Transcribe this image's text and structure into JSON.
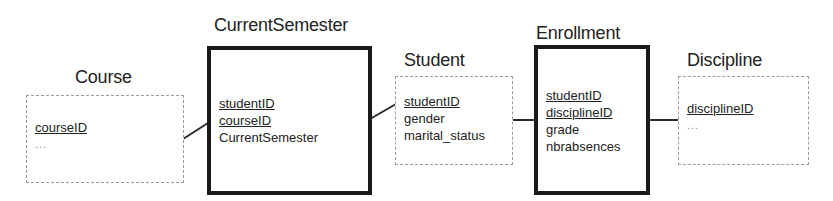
{
  "diagram": {
    "type": "entity-relationship",
    "entities": {
      "course": {
        "title": "Course",
        "style": "weak-border",
        "attributes": [
          {
            "name": "courseID",
            "key": true
          },
          {
            "name": "...",
            "key": false
          }
        ]
      },
      "current_semester": {
        "title": "CurrentSemester",
        "style": "thick-border",
        "attributes": [
          {
            "name": "studentID",
            "key": true
          },
          {
            "name": "courseID",
            "key": true
          },
          {
            "name": "CurrentSemester",
            "key": false
          }
        ]
      },
      "student": {
        "title": "Student",
        "style": "weak-border",
        "attributes": [
          {
            "name": "studentID",
            "key": true
          },
          {
            "name": "gender",
            "key": false
          },
          {
            "name": "marital_status",
            "key": false
          }
        ]
      },
      "enrollment": {
        "title": "Enrollment",
        "style": "thick-border",
        "attributes": [
          {
            "name": "studentID",
            "key": true
          },
          {
            "name": "disciplineID",
            "key": true
          },
          {
            "name": "grade",
            "key": false
          },
          {
            "name": "nbrabsences",
            "key": false
          }
        ]
      },
      "discipline": {
        "title": "Discipline",
        "style": "weak-border",
        "attributes": [
          {
            "name": "disciplineID",
            "key": true
          },
          {
            "name": "...",
            "key": false
          }
        ]
      }
    },
    "relationships": [
      {
        "from": "Course",
        "to": "CurrentSemester"
      },
      {
        "from": "CurrentSemester",
        "to": "Student"
      },
      {
        "from": "Student",
        "to": "Enrollment"
      },
      {
        "from": "Enrollment",
        "to": "Discipline"
      }
    ],
    "colors": {
      "thick_border": "#1a1a1a",
      "thin_border": "#9a9a9a",
      "connector": "#2a2a2a",
      "text": "#222222"
    }
  }
}
